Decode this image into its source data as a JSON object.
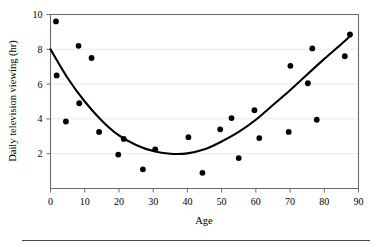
{
  "chart_data": {
    "type": "scatter",
    "title": "",
    "xlabel": "Age",
    "ylabel": "Daily television viewing (hr)",
    "xlim": [
      0,
      90
    ],
    "ylim": [
      0,
      10
    ],
    "xticks": [
      0,
      10,
      20,
      30,
      40,
      50,
      60,
      70,
      80,
      90
    ],
    "yticks": [
      2,
      4,
      6,
      8,
      10
    ],
    "xtick_labels": [
      "0",
      "10",
      "20",
      "30",
      "40",
      "50",
      "60",
      "70",
      "80",
      "90"
    ],
    "ytick_labels": [
      "2",
      "4",
      "6",
      "8",
      "10"
    ],
    "grid": "horizontal",
    "legend": "none",
    "point_color": "#000000",
    "curve_color": "#000000",
    "grid_color": "#e3e3e3",
    "axis_color": "#6b6b6b",
    "points": [
      {
        "x": 1.6,
        "y": 9.6
      },
      {
        "x": 1.8,
        "y": 6.5
      },
      {
        "x": 4.5,
        "y": 3.85
      },
      {
        "x": 8.2,
        "y": 8.2
      },
      {
        "x": 8.4,
        "y": 4.9
      },
      {
        "x": 12.0,
        "y": 7.5
      },
      {
        "x": 14.2,
        "y": 3.25
      },
      {
        "x": 19.8,
        "y": 1.95
      },
      {
        "x": 21.4,
        "y": 2.85
      },
      {
        "x": 27.0,
        "y": 1.1
      },
      {
        "x": 30.6,
        "y": 2.25
      },
      {
        "x": 40.3,
        "y": 2.95
      },
      {
        "x": 44.4,
        "y": 0.9
      },
      {
        "x": 49.6,
        "y": 3.4
      },
      {
        "x": 52.9,
        "y": 4.05
      },
      {
        "x": 55.0,
        "y": 1.75
      },
      {
        "x": 59.6,
        "y": 4.5
      },
      {
        "x": 61.0,
        "y": 2.9
      },
      {
        "x": 69.6,
        "y": 3.25
      },
      {
        "x": 70.1,
        "y": 7.05
      },
      {
        "x": 75.2,
        "y": 6.05
      },
      {
        "x": 76.5,
        "y": 8.05
      },
      {
        "x": 77.8,
        "y": 3.95
      },
      {
        "x": 86.0,
        "y": 7.6
      },
      {
        "x": 87.5,
        "y": 8.85
      }
    ],
    "fit_curve": {
      "kind": "quadratic",
      "description": "U-shaped quadratic regression from (0, 8.0) through minimum near (37, 2.0) to (88, 8.85)",
      "vertex": {
        "x": 37,
        "y": 1.98
      },
      "endpoints": [
        {
          "x": 0,
          "y": 8.0
        },
        {
          "x": 88,
          "y": 8.85
        }
      ],
      "samples": [
        {
          "x": 0,
          "y": 8.0
        },
        {
          "x": 5,
          "y": 6.35
        },
        {
          "x": 10,
          "y": 5.0
        },
        {
          "x": 15,
          "y": 3.9
        },
        {
          "x": 20,
          "y": 3.05
        },
        {
          "x": 25,
          "y": 2.5
        },
        {
          "x": 30,
          "y": 2.15
        },
        {
          "x": 35,
          "y": 2.0
        },
        {
          "x": 40,
          "y": 2.02
        },
        {
          "x": 45,
          "y": 2.25
        },
        {
          "x": 50,
          "y": 2.7
        },
        {
          "x": 55,
          "y": 3.25
        },
        {
          "x": 60,
          "y": 3.95
        },
        {
          "x": 65,
          "y": 4.8
        },
        {
          "x": 70,
          "y": 5.65
        },
        {
          "x": 75,
          "y": 6.55
        },
        {
          "x": 80,
          "y": 7.45
        },
        {
          "x": 85,
          "y": 8.3
        },
        {
          "x": 88,
          "y": 8.85
        }
      ]
    }
  },
  "figure": {
    "footer_rule": true
  }
}
